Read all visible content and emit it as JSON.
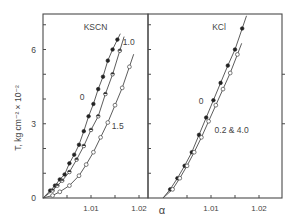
{
  "figure": {
    "ylabel": "T, kg cm⁻² × 10⁻²",
    "xlabel": "α",
    "y_ticks_labeled": [
      {
        "value": 0,
        "label": "0"
      },
      {
        "value": 3,
        "label": "3"
      },
      {
        "value": 6,
        "label": "6"
      }
    ],
    "x_ticks_labeled": [
      {
        "value": 1.01,
        "label": "1.01"
      },
      {
        "value": 1.02,
        "label": "1.02"
      }
    ]
  },
  "chart_data": [
    {
      "type": "line",
      "title": "KSCN",
      "xlabel": "α",
      "ylabel": "T, kg cm⁻² × 10⁻²",
      "xlim": [
        1.0,
        1.0225
      ],
      "ylim": [
        0,
        7.4
      ],
      "x_ticks": [
        1.005,
        1.01,
        1.015,
        1.02
      ],
      "x_tick_labels": [
        "",
        "1.01",
        "",
        "1.02"
      ],
      "y_ticks": [
        1,
        2,
        3,
        4,
        5,
        6,
        7
      ],
      "y_tick_labels": [
        "",
        "",
        "3",
        "",
        "",
        "6",
        ""
      ],
      "grid": false,
      "legend": "inline labels on curves",
      "series": [
        {
          "name": "0",
          "marker": "filled-circle",
          "x": [
            1.0015,
            1.0025,
            1.0035,
            1.0045,
            1.0055,
            1.0065,
            1.0075,
            1.0085,
            1.0095,
            1.0105,
            1.0115,
            1.0125,
            1.0135,
            1.0145,
            1.0155
          ],
          "y": [
            0.3,
            0.5,
            0.75,
            0.95,
            1.4,
            1.75,
            2.15,
            2.7,
            3.3,
            3.8,
            4.4,
            4.9,
            5.55,
            6.0,
            6.4
          ]
        },
        {
          "name": "1.0",
          "marker": "half-filled-circle",
          "x": [
            1.002,
            1.003,
            1.004,
            1.0055,
            1.007,
            1.0085,
            1.01,
            1.0115,
            1.013,
            1.0145,
            1.016
          ],
          "y": [
            0.3,
            0.5,
            0.7,
            1.05,
            1.55,
            2.1,
            2.75,
            3.3,
            4.2,
            5.0,
            5.95
          ]
        },
        {
          "name": "1.5",
          "marker": "open-circle",
          "x": [
            1.002,
            1.0035,
            1.0055,
            1.0075,
            1.009,
            1.0105,
            1.012,
            1.0135,
            1.015,
            1.0165,
            1.018
          ],
          "y": [
            0.1,
            0.25,
            0.5,
            0.9,
            1.35,
            1.85,
            2.45,
            3.05,
            3.75,
            4.45,
            5.3
          ]
        }
      ]
    },
    {
      "type": "line",
      "title": "KCl",
      "xlabel": "α",
      "ylabel": "T, kg cm⁻² × 10⁻²",
      "xlim": [
        1.0,
        1.0245
      ],
      "ylim": [
        0,
        7.4
      ],
      "x_ticks": [
        1.005,
        1.01,
        1.015,
        1.02
      ],
      "x_tick_labels": [
        "",
        "1.01",
        "",
        "1.02"
      ],
      "y_ticks": [
        1,
        2,
        3,
        4,
        5,
        6,
        7
      ],
      "grid": false,
      "legend": "inline labels on curves",
      "series": [
        {
          "name": "0",
          "marker": "filled-circle",
          "x": [
            1.0015,
            1.003,
            1.0045,
            1.006,
            1.0075,
            1.009,
            1.0105,
            1.012,
            1.0135,
            1.015,
            1.0165
          ],
          "y": [
            0.35,
            0.8,
            1.3,
            1.85,
            2.55,
            3.25,
            3.95,
            4.65,
            5.35,
            6.0,
            6.85
          ]
        },
        {
          "name": "0.2 & 4.0",
          "marker": "open-circle",
          "x": [
            1.002,
            1.0035,
            1.005,
            1.0065,
            1.008,
            1.0095,
            1.011,
            1.0125,
            1.014,
            1.0155
          ],
          "y": [
            0.35,
            0.8,
            1.3,
            1.85,
            2.45,
            3.1,
            3.75,
            4.4,
            5.05,
            5.8
          ]
        }
      ]
    }
  ]
}
